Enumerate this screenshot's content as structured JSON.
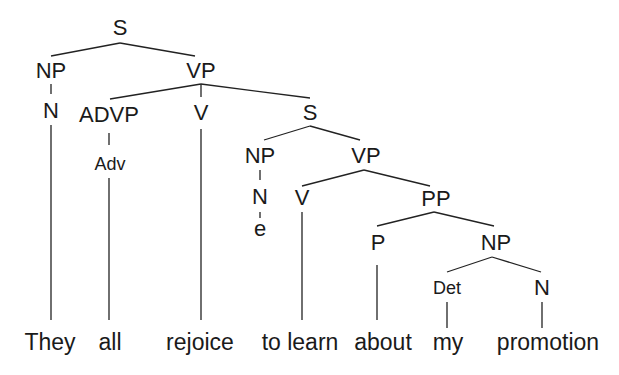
{
  "diagram": {
    "type": "syntax-tree",
    "sentence": "They all rejoice to learn about my promotion",
    "nodes": {
      "s_root": "S",
      "np_subj": "NP",
      "n_subj": "N",
      "vp_main": "VP",
      "advp": "ADVP",
      "adv": "Adv",
      "v_main": "V",
      "s_emb": "S",
      "np_emb": "NP",
      "n_emb": "N",
      "empty": "e",
      "vp_emb": "VP",
      "v_emb": "V",
      "pp": "PP",
      "p": "P",
      "np_obj": "NP",
      "det": "Det",
      "n_obj": "N"
    },
    "words": {
      "w1": "They",
      "w2": "all",
      "w3": "rejoice",
      "w4": "to learn",
      "w5": "about",
      "w6": "my",
      "w7": "promotion"
    }
  }
}
